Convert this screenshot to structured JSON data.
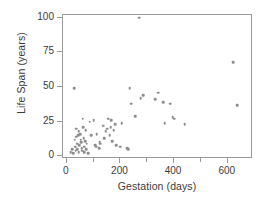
{
  "chart_data": {
    "type": "scatter",
    "title": "",
    "xlabel": "Gestation (days)",
    "ylabel": "Life Span (years)",
    "xlim": [
      -14,
      694
    ],
    "ylim": [
      -2,
      102
    ],
    "grid": false,
    "legend": null,
    "xticks": [
      0,
      200,
      400,
      600
    ],
    "xtick_labels": [
      "0",
      "200",
      "400",
      "600"
    ],
    "xminor_ticks": [
      100,
      300,
      500
    ],
    "yticks": [
      0,
      25,
      50,
      75,
      100
    ],
    "ytick_labels": [
      "0",
      "25",
      "50",
      "75",
      "100"
    ],
    "marker_color": "#8d8d8d",
    "axis_color": "#9a9a9a",
    "text_color": "#3b3b3b",
    "x": [
      14,
      21,
      25,
      28,
      30,
      31,
      33,
      35,
      36,
      38,
      40,
      42,
      44,
      45,
      46,
      50,
      52,
      54,
      56,
      58,
      60,
      61,
      63,
      64,
      66,
      68,
      70,
      72,
      75,
      80,
      85,
      90,
      100,
      105,
      110,
      112,
      120,
      122,
      125,
      135,
      140,
      145,
      150,
      155,
      160,
      163,
      165,
      170,
      175,
      180,
      185,
      200,
      205,
      225,
      230,
      235,
      240,
      255,
      270,
      275,
      285,
      330,
      340,
      360,
      365,
      385,
      395,
      400,
      440,
      620,
      635
    ],
    "y": [
      3,
      5,
      2,
      49,
      12,
      7,
      4,
      14,
      20,
      9,
      5,
      15,
      3,
      18,
      8,
      16,
      12,
      10,
      6,
      4,
      27,
      21,
      13,
      7,
      3,
      11,
      19,
      5,
      9,
      2,
      25,
      15,
      26,
      8,
      7,
      16,
      6,
      10,
      9,
      22,
      13,
      18,
      20,
      27,
      15,
      21,
      26,
      11,
      19,
      23,
      8,
      7,
      24,
      6,
      5,
      49,
      38,
      29,
      100,
      42,
      44,
      41,
      46,
      39,
      24,
      38,
      28,
      27,
      23,
      68,
      37
    ]
  }
}
